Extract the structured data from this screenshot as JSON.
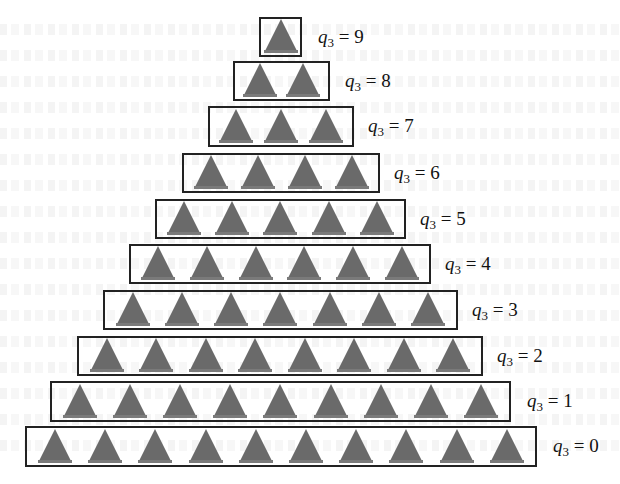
{
  "figure": {
    "type": "pyramid-diagram",
    "variable": "q",
    "subscript": "3",
    "equals": "=",
    "shape": "triangle",
    "triangle_color": "#6a6a6a",
    "box_border_color": "#222222",
    "rows": [
      {
        "value": "9",
        "count": 1,
        "box": {
          "x": 259,
          "y": 17,
          "w": 43,
          "h": 40
        },
        "label_x": 318
      },
      {
        "value": "8",
        "count": 2,
        "box": {
          "x": 233,
          "y": 61,
          "w": 97,
          "h": 40
        },
        "label_x": 345
      },
      {
        "value": "7",
        "count": 3,
        "box": {
          "x": 208,
          "y": 106,
          "w": 146,
          "h": 41
        },
        "label_x": 368
      },
      {
        "value": "6",
        "count": 4,
        "box": {
          "x": 182,
          "y": 153,
          "w": 198,
          "h": 40
        },
        "label_x": 394
      },
      {
        "value": "5",
        "count": 5,
        "box": {
          "x": 155,
          "y": 199,
          "w": 251,
          "h": 40
        },
        "label_x": 420
      },
      {
        "value": "4",
        "count": 6,
        "box": {
          "x": 129,
          "y": 244,
          "w": 302,
          "h": 40
        },
        "label_x": 445
      },
      {
        "value": "3",
        "count": 7,
        "box": {
          "x": 103,
          "y": 290,
          "w": 355,
          "h": 40
        },
        "label_x": 472
      },
      {
        "value": "2",
        "count": 8,
        "box": {
          "x": 77,
          "y": 336,
          "w": 406,
          "h": 40
        },
        "label_x": 497
      },
      {
        "value": "1",
        "count": 9,
        "box": {
          "x": 50,
          "y": 381,
          "w": 461,
          "h": 41
        },
        "label_x": 527
      },
      {
        "value": "0",
        "count": 10,
        "box": {
          "x": 25,
          "y": 426,
          "w": 512,
          "h": 41
        },
        "label_x": 553
      }
    ]
  }
}
